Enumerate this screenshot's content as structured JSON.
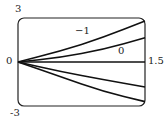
{
  "chart_data": {
    "type": "line",
    "title": "",
    "xlabel": "",
    "ylabel": "",
    "xlim": [
      0,
      1.5
    ],
    "ylim": [
      -3,
      3
    ],
    "grid": false,
    "legend": "none",
    "tick_labels": {
      "y_top": "3",
      "y_bottom": "-3",
      "x_left": "0",
      "x_right": "1.5"
    },
    "annotations": [
      {
        "text": "−1",
        "curve_index": 0
      },
      {
        "text": "0",
        "curve_index": 1
      }
    ],
    "series": [
      {
        "name": "curve 1 (top, labeled -1)",
        "x": [
          0,
          0.5,
          1.0,
          1.5
        ],
        "y": [
          0,
          0.75,
          1.65,
          2.8
        ]
      },
      {
        "name": "curve 2 (labeled 0)",
        "x": [
          0,
          0.5,
          1.0,
          1.5
        ],
        "y": [
          0,
          0.3,
          0.85,
          1.65
        ]
      },
      {
        "name": "curve 3 (horizontal)",
        "x": [
          0,
          1.5
        ],
        "y": [
          0,
          0
        ]
      },
      {
        "name": "curve 4",
        "x": [
          0,
          0.5,
          1.0,
          1.5
        ],
        "y": [
          0,
          -0.65,
          -1.2,
          -1.7
        ]
      },
      {
        "name": "curve 5 (bottom)",
        "x": [
          0,
          0.5,
          1.0,
          1.5
        ],
        "y": [
          0,
          -1.0,
          -2.0,
          -2.7
        ]
      }
    ]
  }
}
